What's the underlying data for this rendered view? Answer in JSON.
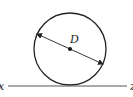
{
  "diagram": {
    "center_label": "D",
    "left_label": "x",
    "right_label": "z",
    "stroke_color": "#222222",
    "line_color": "#555555",
    "background": "#ffffff"
  }
}
